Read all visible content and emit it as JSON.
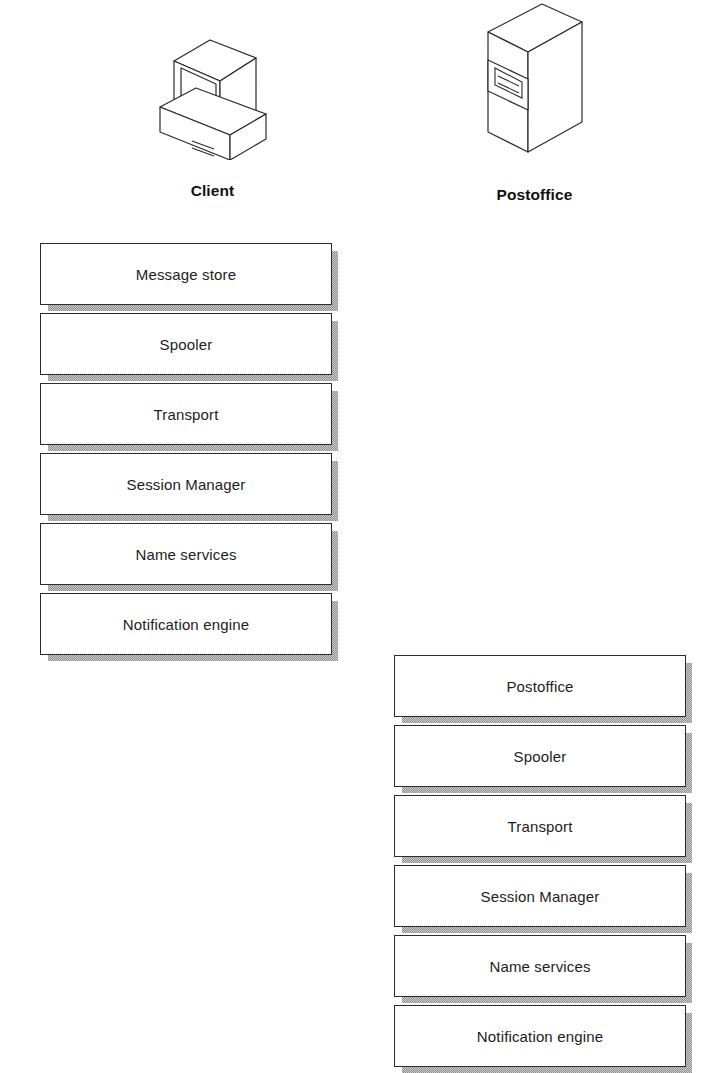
{
  "diagram": {
    "background_color": "#ffffff",
    "line_color": "#2b2b2b",
    "shadow_color": "#8f8f8f"
  },
  "nodes": [
    {
      "id": "client",
      "label": "Client",
      "icon": "desktop-computer-icon",
      "layers": [
        {
          "label": "Message store"
        },
        {
          "label": "Spooler"
        },
        {
          "label": "Transport"
        },
        {
          "label": "Session Manager"
        },
        {
          "label": "Name services"
        },
        {
          "label": "Notification engine"
        }
      ]
    },
    {
      "id": "postoffice",
      "label": "Postoffice",
      "icon": "server-tower-icon",
      "layers": [
        {
          "label": "Postoffice"
        },
        {
          "label": "Spooler"
        },
        {
          "label": "Transport"
        },
        {
          "label": "Session Manager"
        },
        {
          "label": "Name services"
        },
        {
          "label": "Notification engine"
        }
      ]
    }
  ]
}
